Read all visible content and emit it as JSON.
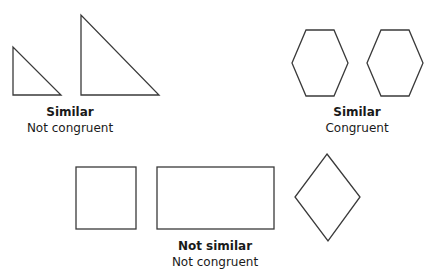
{
  "groups": [
    {
      "id": "triangles",
      "title": "Similar",
      "subtitle": "Not congruent",
      "label_x": 70,
      "label_y": 106
    },
    {
      "id": "hexagons",
      "title": "Similar",
      "subtitle": "Congruent",
      "label_x": 357,
      "label_y": 106
    },
    {
      "id": "quadrilaterals",
      "title": "Not similar",
      "subtitle": "Not congruent",
      "label_x": 215,
      "label_y": 240
    }
  ],
  "shapes": {
    "small_triangle": "13,47 13,95 61,95",
    "large_triangle": "81,15 81,95 159,95",
    "hexagon_1": "306,30 334,30 348,63 334,96 306,96 292,63",
    "hexagon_2": "381,30 409,30 423,63 409,96 381,96 367,63",
    "square": {
      "x": 76,
      "y": 167,
      "w": 60,
      "h": 62
    },
    "rectangle": {
      "x": 157,
      "y": 167,
      "w": 117,
      "h": 62
    },
    "rhombus": "327,154 360,197 328,241 295,197"
  },
  "colors": {
    "stroke": "#3a3a3a",
    "text": "#1a1a1a",
    "background": "#ffffff"
  }
}
